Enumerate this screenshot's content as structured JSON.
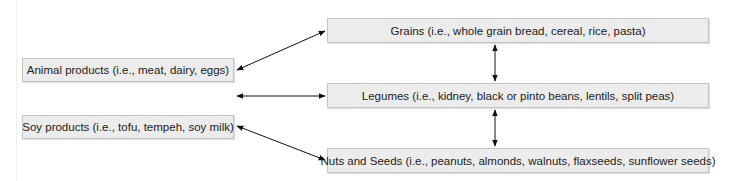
{
  "diagram": {
    "left_nodes": [
      {
        "id": "animal",
        "label": "Animal products (i.e., meat, dairy, eggs)"
      },
      {
        "id": "soy",
        "label": "Soy products (i.e., tofu, tempeh, soy milk)"
      }
    ],
    "right_nodes": [
      {
        "id": "grains",
        "label": "Grains (i.e., whole grain bread, cereal, rice, pasta)"
      },
      {
        "id": "legumes",
        "label": "Legumes (i.e., kidney, black or pinto beans, lentils, split peas)"
      },
      {
        "id": "nuts",
        "label": "Nuts and Seeds (i.e., peanuts, almonds, walnuts, flaxseeds, sunflower seeds)"
      }
    ],
    "edges": [
      {
        "from": "animal",
        "to": "grains",
        "type": "bidirectional"
      },
      {
        "from": "left-middle",
        "to": "legumes",
        "type": "bidirectional"
      },
      {
        "from": "soy",
        "to": "nuts",
        "type": "bidirectional"
      },
      {
        "from": "grains",
        "to": "legumes",
        "type": "bidirectional"
      },
      {
        "from": "legumes",
        "to": "nuts",
        "type": "bidirectional"
      }
    ],
    "colors": {
      "box_fill": "#ececec",
      "box_border": "#c4c4c4",
      "arrow": "#111111",
      "text": "#222222"
    }
  }
}
